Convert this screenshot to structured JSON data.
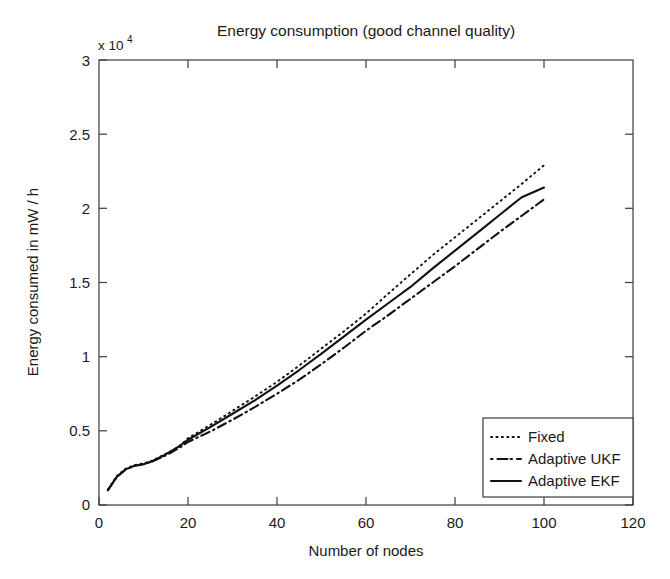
{
  "chart_data": {
    "type": "line",
    "title": "Energy consumption (good channel quality)",
    "xlabel": "Number of nodes",
    "ylabel": "Energy consumed in mW / h",
    "y_multiplier_base": "x 10",
    "y_multiplier_exponent": "4",
    "y_multiplier_text": "x 10^4",
    "xlim": [
      0,
      120
    ],
    "ylim": [
      0,
      30000
    ],
    "y_tick_labels": [
      "0",
      "0.5",
      "1",
      "1.5",
      "2",
      "2.5",
      "3"
    ],
    "y_tick_values": [
      0,
      5000,
      10000,
      15000,
      20000,
      25000,
      30000
    ],
    "x_tick_labels": [
      "0",
      "20",
      "40",
      "60",
      "80",
      "100",
      "120"
    ],
    "x_tick_values": [
      0,
      20,
      40,
      60,
      80,
      100,
      120
    ],
    "grid": false,
    "legend_position": "lower right",
    "legend_entries": [
      "Fixed",
      "Adaptive UKF",
      "Adaptive EKF"
    ],
    "series": [
      {
        "name": "Fixed",
        "style": "dotted",
        "color": "#111111",
        "x": [
          2,
          4,
          6,
          8,
          10,
          12,
          14,
          16,
          18,
          20,
          25,
          30,
          35,
          40,
          45,
          50,
          55,
          60,
          65,
          70,
          75,
          80,
          85,
          90,
          95,
          100
        ],
        "y": [
          1050,
          1950,
          2450,
          2700,
          2800,
          3000,
          3300,
          3600,
          3950,
          4500,
          5400,
          6350,
          7300,
          8300,
          9400,
          10550,
          11700,
          12900,
          14250,
          15550,
          16850,
          18050,
          19250,
          20450,
          21650,
          22900
        ]
      },
      {
        "name": "Adaptive UKF",
        "style": "dash-dot",
        "color": "#111111",
        "x": [
          2,
          4,
          6,
          8,
          10,
          12,
          14,
          16,
          18,
          20,
          25,
          30,
          35,
          40,
          45,
          50,
          55,
          60,
          65,
          70,
          75,
          80,
          85,
          90,
          95,
          100
        ],
        "y": [
          1000,
          1900,
          2400,
          2650,
          2750,
          2950,
          3200,
          3500,
          3850,
          4250,
          4950,
          5750,
          6600,
          7500,
          8450,
          9500,
          10600,
          11750,
          12800,
          13900,
          15000,
          16100,
          17250,
          18400,
          19500,
          20600
        ]
      },
      {
        "name": "Adaptive EKF",
        "style": "solid",
        "color": "#111111",
        "x": [
          2,
          4,
          6,
          8,
          10,
          12,
          14,
          16,
          18,
          20,
          25,
          30,
          35,
          40,
          45,
          50,
          55,
          60,
          65,
          70,
          75,
          80,
          85,
          90,
          95,
          100
        ],
        "y": [
          1000,
          1900,
          2400,
          2650,
          2750,
          2950,
          3250,
          3600,
          3950,
          4400,
          5250,
          6150,
          7050,
          8050,
          9100,
          10200,
          11350,
          12500,
          13600,
          14700,
          15950,
          17150,
          18350,
          19550,
          20750,
          21400
        ]
      }
    ]
  }
}
